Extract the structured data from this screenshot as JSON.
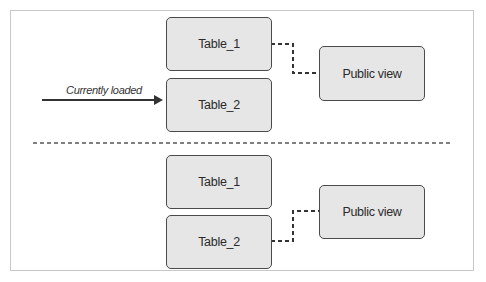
{
  "diagram": {
    "top_section": {
      "tables": [
        {
          "label": "Table_1"
        },
        {
          "label": "Table_2"
        }
      ],
      "view": {
        "label": "Public view",
        "connected_to": "Table_1"
      },
      "pointer": {
        "label": "Currently loaded",
        "points_to": "Table_2"
      }
    },
    "bottom_section": {
      "tables": [
        {
          "label": "Table_1"
        },
        {
          "label": "Table_2"
        }
      ],
      "view": {
        "label": "Public view",
        "connected_to": "Table_2"
      }
    },
    "colors": {
      "box_fill": "#e6e6e6",
      "box_border": "#4a4a4a",
      "line": "#333333",
      "frame": "#c8c8c8"
    }
  }
}
